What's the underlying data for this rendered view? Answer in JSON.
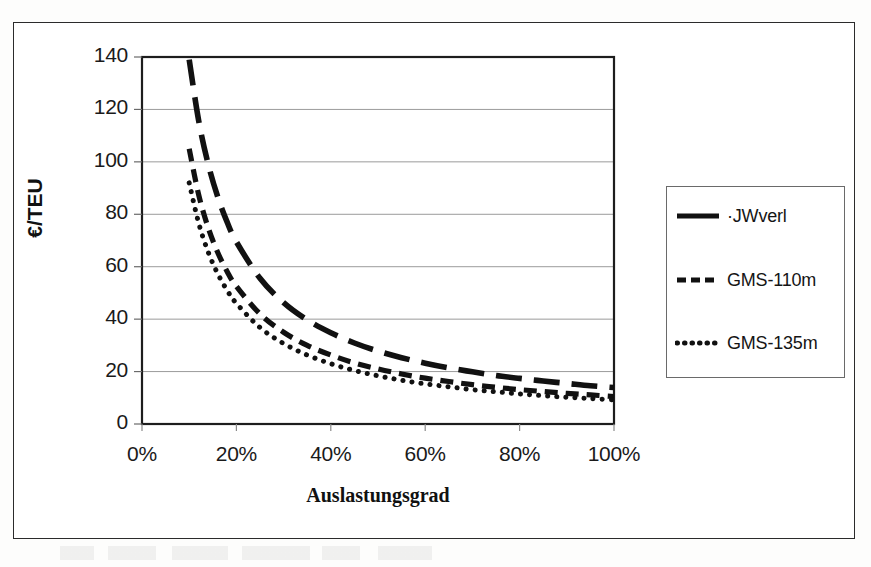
{
  "figure": {
    "background_color": "#ffffff",
    "frame_color": "#2b2b2b",
    "ink_color": "#111111",
    "gridline_color": "#9b9b9b"
  },
  "axes": {
    "y_title": "€/TEU",
    "x_title": "Auslastungsgrad",
    "y_ticks": [
      "0",
      "20",
      "40",
      "60",
      "80",
      "100",
      "120",
      "140"
    ],
    "x_ticks": [
      "0%",
      "20%",
      "40%",
      "60%",
      "80%",
      "100%"
    ]
  },
  "legend": {
    "entries": [
      {
        "label": "·JWverl",
        "style": "long-dash"
      },
      {
        "label": "GMS-110m",
        "style": "dash"
      },
      {
        "label": "GMS-135m",
        "style": "dot"
      }
    ]
  },
  "chart_data": {
    "type": "line",
    "title": "",
    "subtitle": "",
    "xlabel": "Auslastungsgrad",
    "ylabel": "€/TEU",
    "xlim": [
      0,
      100
    ],
    "ylim": [
      0,
      140
    ],
    "x_tick_values": [
      0,
      20,
      40,
      60,
      80,
      100
    ],
    "x_tick_labels": [
      "0%",
      "20%",
      "40%",
      "60%",
      "80%",
      "100%"
    ],
    "y_tick_values": [
      0,
      20,
      40,
      60,
      80,
      100,
      120,
      140
    ],
    "y_tick_labels": [
      "0",
      "20",
      "40",
      "60",
      "80",
      "100",
      "120",
      "140"
    ],
    "grid": "horizontal",
    "legend_position": "right",
    "x": [
      10,
      12,
      14,
      16,
      18,
      20,
      25,
      30,
      35,
      40,
      45,
      50,
      55,
      60,
      65,
      70,
      75,
      80,
      85,
      90,
      95,
      100
    ],
    "series": [
      {
        "name": "·JWverl",
        "style": "long-dash",
        "values": [
          139.0,
          115.8,
          99.3,
          86.9,
          77.2,
          69.5,
          55.6,
          46.3,
          39.7,
          34.8,
          30.9,
          27.8,
          25.3,
          23.2,
          21.4,
          19.9,
          18.5,
          17.4,
          16.4,
          15.5,
          14.6,
          13.9
        ]
      },
      {
        "name": "GMS-110m",
        "style": "dash",
        "values": [
          105.0,
          87.5,
          75.0,
          65.6,
          58.3,
          52.5,
          42.0,
          35.0,
          30.0,
          26.3,
          23.3,
          21.0,
          19.1,
          17.5,
          16.2,
          15.0,
          14.0,
          13.1,
          12.4,
          11.7,
          11.1,
          10.5
        ]
      },
      {
        "name": "GMS-135m",
        "style": "dot",
        "values": [
          92.0,
          76.7,
          65.7,
          57.5,
          51.1,
          46.0,
          36.8,
          30.7,
          26.3,
          23.0,
          20.4,
          18.4,
          16.7,
          15.3,
          14.2,
          13.1,
          12.3,
          11.5,
          10.8,
          10.2,
          9.7,
          9.2
        ]
      }
    ]
  }
}
